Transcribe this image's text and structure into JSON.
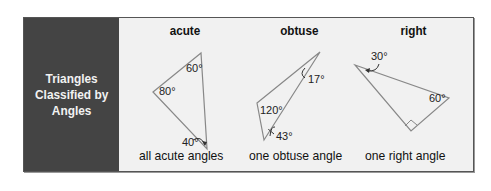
{
  "title": "Triangles Classified by Angles",
  "title_lines": [
    "Triangles",
    "Classified by",
    "Angles"
  ],
  "colors": {
    "side_panel": "#444444",
    "content_bg": "#f1f1f1",
    "stroke": "#888888"
  },
  "triangles": [
    {
      "type": "acute",
      "angles": [
        "80°",
        "60°",
        "40°"
      ],
      "caption": "all acute angles"
    },
    {
      "type": "obtuse",
      "angles": [
        "120°",
        "17°",
        "43°"
      ],
      "caption": "one obtuse angle"
    },
    {
      "type": "right",
      "angles": [
        "30°",
        "60°"
      ],
      "caption": "one right angle"
    }
  ]
}
